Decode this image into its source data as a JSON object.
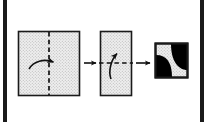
{
  "diagram": {
    "type": "paper-folding-puzzle",
    "colors": {
      "paper_fill": "#ededed",
      "paper_stipple": "#b8b8b8",
      "outline": "#1a1a1a",
      "hole_fill": "#000000",
      "background": "#ffffff",
      "edge_band": "#1a1a1a"
    },
    "steps": [
      {
        "id": "step-1",
        "label": "Unfolded square sheet",
        "shape": "square",
        "x": 18,
        "y": 31,
        "width": 62,
        "height": 65,
        "crease": {
          "orientation": "vertical",
          "style": "dashed",
          "position_pct": 50
        },
        "fold_arrow": {
          "direction": "right",
          "curve": "over-vertical-crease",
          "description": "left half folds over to the right"
        }
      },
      {
        "id": "step-2",
        "label": "Folded once into a tall rectangle",
        "shape": "rectangle",
        "x": 100,
        "y": 31,
        "width": 32,
        "height": 65,
        "crease": {
          "orientation": "horizontal",
          "style": "dashed",
          "position_pct": 50
        },
        "fold_arrow": {
          "direction": "up",
          "curve": "over-horizontal-crease",
          "description": "bottom half folds upward"
        }
      },
      {
        "id": "step-3",
        "label": "Folded twice with punched holes",
        "shape": "square",
        "x": 155,
        "y": 43,
        "width": 33,
        "height": 35,
        "crease": null,
        "fold_arrow": null,
        "holes": [
          {
            "id": "hole-top-right",
            "corner": "top-right",
            "style": "quarter-circle-concave",
            "fill": "#000000"
          },
          {
            "id": "hole-bottom-left",
            "corner": "bottom-left",
            "style": "quarter-circle-convex",
            "fill": "#000000"
          }
        ]
      }
    ],
    "connectors": [
      {
        "id": "arrow-1",
        "from": "step-1",
        "to": "step-2",
        "direction": "right",
        "x1": 84,
        "x2": 97,
        "y": 63
      },
      {
        "id": "arrow-2",
        "from": "step-2",
        "to": "step-3",
        "direction": "right",
        "x1": 136,
        "x2": 151,
        "y": 63
      }
    ]
  }
}
